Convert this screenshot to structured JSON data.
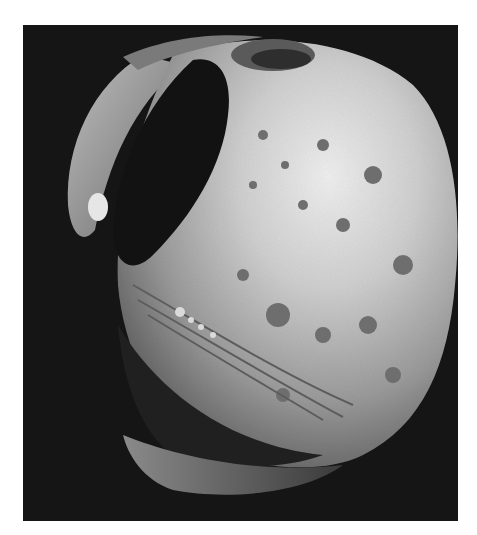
{
  "image": {
    "subject": "Phobos moon, grayscale photograph",
    "background_color": "#151515",
    "frame_color": "#ffffff",
    "colors": {
      "shadow": "#121212",
      "limb_dark": "#3a3a3a",
      "surface_mid": "#8a8a8a",
      "surface_light": "#d8d8d8",
      "highlight": "#f2f2f2"
    }
  }
}
